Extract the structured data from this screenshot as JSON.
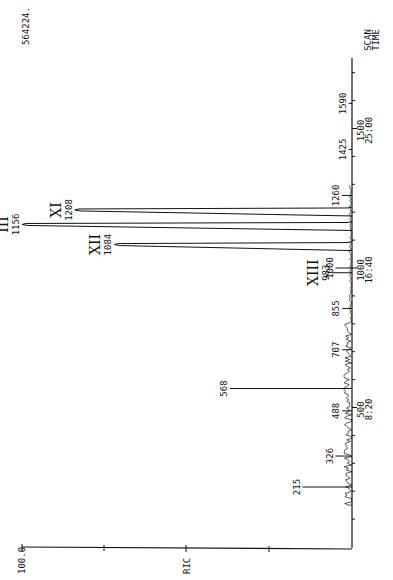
{
  "chart_data": {
    "type": "line",
    "title": "",
    "orientation": "rotated 90deg (scan axis vertical, intensity to the left)",
    "xlabel": "SCAN / TIME",
    "ylabel": "RIC",
    "max_intensity_label": "100.0",
    "total_counts_label": "564224.",
    "scan_ticks": [
      {
        "scan": "500",
        "time": "8:20"
      },
      {
        "scan": "1000",
        "time": "16:40"
      },
      {
        "scan": "1500",
        "time": "25:00"
      }
    ],
    "peaks": [
      {
        "scan": 215,
        "label": "215",
        "rel_intensity": 15,
        "compound": ""
      },
      {
        "scan": 326,
        "label": "326",
        "rel_intensity": 5,
        "compound": ""
      },
      {
        "scan": 488,
        "label": "488",
        "rel_intensity": 3,
        "compound": ""
      },
      {
        "scan": 568,
        "label": "568",
        "rel_intensity": 37,
        "compound": ""
      },
      {
        "scan": 707,
        "label": "707",
        "rel_intensity": 3,
        "compound": ""
      },
      {
        "scan": 855,
        "label": "855",
        "rel_intensity": 3,
        "compound": ""
      },
      {
        "scan": 983,
        "label": "983",
        "rel_intensity": 6,
        "compound": "XIII"
      },
      {
        "scan": 1000,
        "label": "1000",
        "rel_intensity": 5,
        "compound": ""
      },
      {
        "scan": 1084,
        "label": "1084",
        "rel_intensity": 72,
        "compound": "XII"
      },
      {
        "scan": 1156,
        "label": "1156",
        "rel_intensity": 100,
        "compound": "III"
      },
      {
        "scan": 1208,
        "label": "1208",
        "rel_intensity": 84,
        "compound": "XI"
      },
      {
        "scan": 1260,
        "label": "1260",
        "rel_intensity": 3,
        "compound": ""
      },
      {
        "scan": 1425,
        "label": "1425",
        "rel_intensity": 1,
        "compound": ""
      },
      {
        "scan": 1590,
        "label": "1590",
        "rel_intensity": 1,
        "compound": ""
      }
    ],
    "scan_range": [
      0,
      1700
    ],
    "ylim": [
      0,
      100
    ],
    "grid": false,
    "legend": null
  },
  "labels": {
    "total": "564224.",
    "scan_time_1": "SCAN",
    "scan_time_2": "TIME",
    "ric": "RIC",
    "max": "100.0"
  }
}
